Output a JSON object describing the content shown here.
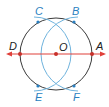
{
  "diagram": {
    "colors": {
      "circle": "#3a3a3a",
      "arcs": "#6fb3dd",
      "line": "#e0403a",
      "point": "#c8302a",
      "bluepoint": "#2a7fc0"
    },
    "points": {
      "A": {
        "label": "A"
      },
      "B": {
        "label": "B"
      },
      "C": {
        "label": "C"
      },
      "D": {
        "label": "D"
      },
      "E": {
        "label": "E"
      },
      "F": {
        "label": "F"
      },
      "O": {
        "label": "O"
      }
    }
  }
}
